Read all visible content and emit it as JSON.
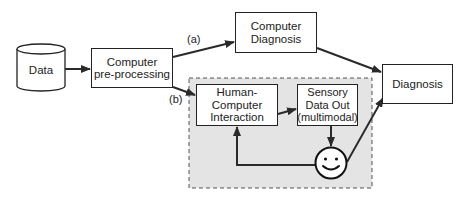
{
  "diagram": {
    "nodes": {
      "data": {
        "label": "Data",
        "shape": "cylinder"
      },
      "preprocessing": {
        "label": "Computer\npre-processing",
        "line1": "Computer",
        "line2": "pre-processing",
        "shape": "rectangle"
      },
      "computer_diagnosis": {
        "label": "Computer\nDiagnosis",
        "line1": "Computer",
        "line2": "Diagnosis",
        "shape": "rectangle"
      },
      "diagnosis": {
        "label": "Diagnosis",
        "shape": "rectangle"
      },
      "hci": {
        "label": "Human-\nComputer\nInteraction",
        "line1": "Human-",
        "line2": "Computer",
        "line3": "Interaction",
        "shape": "rectangle"
      },
      "sensory": {
        "label": "Sensory\nData Out\n(multimodal)",
        "line1": "Sensory",
        "line2": "Data Out",
        "line3": "(multimodal)",
        "shape": "rectangle"
      },
      "human": {
        "label": "",
        "shape": "smiley-face",
        "icon": "smiley-face-icon"
      }
    },
    "edges": [
      {
        "from": "data",
        "to": "preprocessing",
        "label": ""
      },
      {
        "from": "preprocessing",
        "to": "computer_diagnosis",
        "label": "(a)"
      },
      {
        "from": "preprocessing",
        "to": "hci",
        "label": "(b)"
      },
      {
        "from": "computer_diagnosis",
        "to": "diagnosis",
        "label": ""
      },
      {
        "from": "hci",
        "to": "sensory",
        "label": ""
      },
      {
        "from": "sensory",
        "to": "human",
        "label": ""
      },
      {
        "from": "human",
        "to": "hci",
        "label": ""
      },
      {
        "from": "human",
        "to": "diagnosis",
        "label": ""
      }
    ],
    "edge_labels": {
      "a": "(a)",
      "b": "(b)"
    },
    "group": {
      "name": "human-in-the-loop",
      "style": "dashed-gray-region",
      "fill": "#e6e6e6"
    }
  }
}
